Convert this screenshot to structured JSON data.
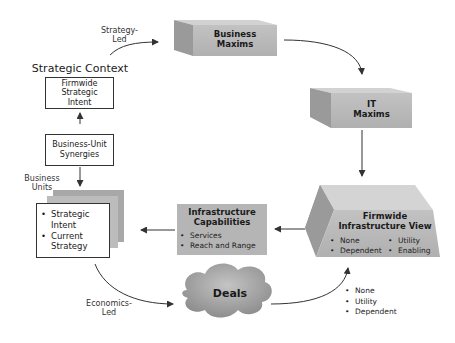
{
  "diagram": {
    "strategic_context": {
      "title": "Strategic Context",
      "firmwide_box": [
        "Firmwide",
        "Strategic",
        "Intent"
      ],
      "synergies_box": [
        "Business-Unit",
        "Synergies"
      ],
      "business_units_label": [
        "Business",
        "Units"
      ],
      "business_unit_items": [
        "Strategic Intent",
        "Current Strategy"
      ]
    },
    "strategy_led_label": [
      "Strategy-",
      "Led"
    ],
    "economics_led_label": [
      "Economics-",
      "Led"
    ],
    "business_maxims": [
      "Business",
      "Maxims"
    ],
    "it_maxims": [
      "IT",
      "Maxims"
    ],
    "firmwide_infra_view": {
      "title": [
        "Firmwide",
        "Infrastructure View"
      ],
      "items_left": [
        "None",
        "Dependent"
      ],
      "items_right": [
        "Utility",
        "Enabling"
      ]
    },
    "infra_capabilities": {
      "title": [
        "Infrastructure",
        "Capabilities"
      ],
      "items": [
        "Services",
        "Reach and Range"
      ]
    },
    "deals": {
      "label": "Deals"
    },
    "deal_outcomes": [
      "None",
      "Utility",
      "Dependent"
    ],
    "colors": {
      "box_front": "#b9b9b9",
      "box_top": "#d2d2d2",
      "box_side": "#999999",
      "panel": "#d4d4d4",
      "arrow": "#333333"
    }
  }
}
